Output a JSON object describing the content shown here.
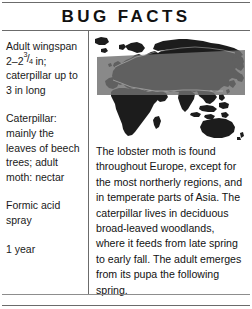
{
  "card": {
    "title": "BUG FACTS"
  },
  "specs": [
    {
      "name": "wingspan",
      "lead": "Adult wingspan",
      "range_prefix": "2–2",
      "frac_num": "3",
      "frac_slash": "/",
      "frac_den": "4",
      "unit": " in;",
      "tail": "caterpillar up to 3 in long"
    },
    {
      "name": "diet",
      "text": "Caterpillar: mainly the leaves of beech trees; adult moth: nectar"
    },
    {
      "name": "defense",
      "text": "Formic acid spray"
    },
    {
      "name": "lifespan",
      "text": "1 year"
    }
  ],
  "map": {
    "icon": "world-map-distribution",
    "land_color": "#1c1c1c",
    "range_band_color": "#6f6f6f",
    "ocean_color": "#ffffff"
  },
  "description": {
    "text": "The lobster moth is found throughout Europe, except for the most northerly regions, and in temperate parts of Asia. The caterpillar lives in deciduous broad-leaved woodlands, where it feeds from late spring to early fall. The adult emerges from its pupa the following spring."
  }
}
